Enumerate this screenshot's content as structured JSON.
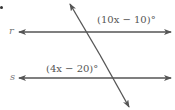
{
  "diagram": {
    "lines": [
      {
        "name": "r",
        "label": "r"
      },
      {
        "name": "s",
        "label": "s"
      }
    ],
    "transversal": "t",
    "angles": {
      "top_angle": "(10x − 10)°",
      "bottom_angle": "(4x − 20)°"
    },
    "colors": {
      "line": "#555555",
      "text": "#666666"
    }
  }
}
